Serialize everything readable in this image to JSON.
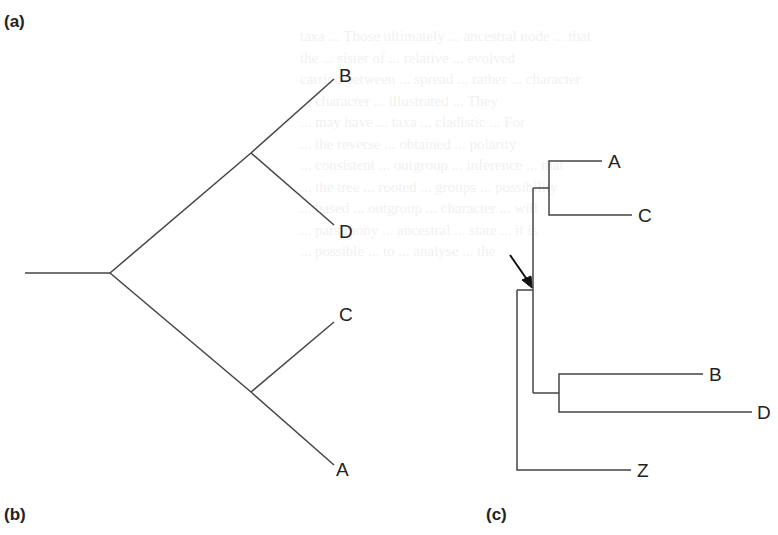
{
  "figure": {
    "panel_labels": {
      "a": "(a)",
      "b": "(b)",
      "c": "(c)"
    },
    "tree_ab": {
      "description": "Unrooted/rooted tree with two clades: (B,D) and (C,A)",
      "taxa": [
        "B",
        "D",
        "C",
        "A"
      ],
      "topology": "((B,D),(C,A))"
    },
    "tree_c": {
      "description": "Rooted cladogram with outgroup Z; arrow marks the root node of ingroup",
      "taxa": [
        "A",
        "C",
        "B",
        "D",
        "Z"
      ],
      "topology": "(((A,C),(B,D)),Z)",
      "arrow": "root-marker"
    },
    "line_color": "#444444",
    "text_color": "#222222"
  }
}
